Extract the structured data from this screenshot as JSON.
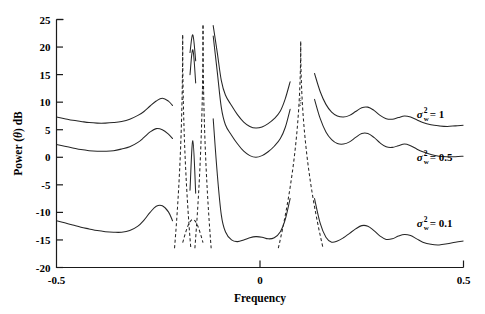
{
  "figure": {
    "background": "#ffffff",
    "ink_color": "#262626"
  },
  "axes": {
    "x_label": "Frequency",
    "y_label_prefix": "Power (",
    "y_label_theta": "θ",
    "y_label_suffix": ") dB",
    "y_label_full": "Power (θ) dB",
    "x_ticks": [
      "-0.5",
      "0",
      "0.5"
    ],
    "x_tick_values": [
      -0.5,
      0,
      0.5
    ],
    "y_ticks": [
      "25",
      "20",
      "15",
      "10",
      "5",
      "0",
      "-5",
      "-10",
      "-15",
      "-20"
    ],
    "y_tick_values": [
      25,
      20,
      15,
      10,
      5,
      0,
      -5,
      -10,
      -15,
      -20
    ],
    "xlim": [
      -0.5,
      0.5
    ],
    "ylim": [
      -20,
      25
    ]
  },
  "annotations": [
    {
      "id": "sigma-1",
      "symbol": "σ",
      "sub": "w",
      "sup": "2",
      "equals": "= 1",
      "value": 1,
      "x": 0.385,
      "y": 7.2
    },
    {
      "id": "sigma-05",
      "symbol": "σ",
      "sub": "w",
      "sup": "2",
      "equals": "= 0.5",
      "value": 0.5,
      "x": 0.385,
      "y": -0.6
    },
    {
      "id": "sigma-01",
      "symbol": "σ",
      "sub": "w",
      "sup": "2",
      "equals": "= 0.1",
      "value": 0.1,
      "x": 0.385,
      "y": -12.6
    }
  ],
  "chart_data": {
    "type": "line",
    "title": "",
    "xlabel": "Frequency",
    "ylabel": "Power (θ) dB",
    "xlim": [
      -0.5,
      0.5
    ],
    "ylim": [
      -20,
      25
    ],
    "grid": false,
    "legend": "inline-right-annotations",
    "x_ticks": [
      -0.5,
      0,
      0.5
    ],
    "y_ticks": [
      25,
      20,
      15,
      10,
      5,
      0,
      -5,
      -10,
      -15,
      -20
    ],
    "series": [
      {
        "name": "sigma_w^2 = 1",
        "style": "solid",
        "linestyle": "-",
        "peak_frequencies": [
          -0.19,
          -0.14,
          0.1
        ],
        "peak_values_db": [
          22.2,
          23.9,
          21.0
        ],
        "x": [
          -0.5,
          -0.48,
          -0.46,
          -0.44,
          -0.42,
          -0.4,
          -0.38,
          -0.36,
          -0.34,
          -0.32,
          -0.3,
          -0.285,
          -0.27,
          -0.255,
          -0.24,
          -0.225,
          -0.215,
          -0.205,
          -0.198,
          -0.192,
          -0.186,
          -0.18,
          -0.172,
          -0.165,
          -0.158,
          -0.15,
          -0.144,
          -0.138,
          -0.132,
          -0.125,
          -0.115,
          -0.105,
          -0.095,
          -0.085,
          -0.07,
          -0.055,
          -0.04,
          -0.025,
          -0.01,
          0.005,
          0.02,
          0.035,
          0.05,
          0.062,
          0.074,
          0.086,
          0.096,
          0.104,
          0.112,
          0.122,
          0.134,
          0.148,
          0.162,
          0.176,
          0.19,
          0.205,
          0.22,
          0.235,
          0.25,
          0.265,
          0.28,
          0.295,
          0.31,
          0.325,
          0.34,
          0.355,
          0.37,
          0.385,
          0.4,
          0.42,
          0.44,
          0.46,
          0.48,
          0.5
        ],
        "y": [
          7.3,
          7.0,
          6.7,
          6.5,
          6.3,
          6.2,
          6.2,
          6.3,
          6.5,
          6.9,
          7.6,
          8.3,
          9.3,
          10.2,
          10.7,
          10.2,
          9.4,
          8.5,
          8.2,
          9.0,
          11.5,
          15.0,
          19.0,
          22.2,
          17.5,
          11.9,
          10.3,
          11.2,
          14.5,
          19.5,
          23.9,
          19.0,
          13.9,
          11.3,
          9.4,
          7.7,
          6.4,
          5.6,
          5.3,
          5.5,
          6.1,
          7.0,
          8.4,
          10.6,
          13.7,
          17.5,
          20.2,
          21.0,
          20.5,
          18.3,
          15.2,
          11.9,
          9.6,
          8.2,
          7.5,
          7.3,
          7.6,
          8.3,
          9.0,
          9.1,
          8.5,
          7.6,
          7.0,
          6.9,
          7.2,
          7.5,
          7.3,
          6.8,
          6.3,
          5.9,
          5.7,
          5.6,
          5.7,
          5.8
        ]
      },
      {
        "name": "sigma_w^2 = 0.5",
        "style": "solid",
        "linestyle": "-",
        "peak_frequencies": [
          -0.19,
          -0.14,
          0.1
        ],
        "peak_values_db": [
          22.2,
          23.9,
          21.0
        ],
        "x": [
          -0.5,
          -0.48,
          -0.46,
          -0.44,
          -0.42,
          -0.4,
          -0.38,
          -0.36,
          -0.34,
          -0.32,
          -0.3,
          -0.285,
          -0.27,
          -0.255,
          -0.24,
          -0.225,
          -0.215,
          -0.205,
          -0.198,
          -0.192,
          -0.186,
          -0.18,
          -0.172,
          -0.165,
          -0.158,
          -0.15,
          -0.144,
          -0.138,
          -0.132,
          -0.125,
          -0.115,
          -0.105,
          -0.095,
          -0.085,
          -0.07,
          -0.055,
          -0.04,
          -0.025,
          -0.01,
          0.005,
          0.02,
          0.035,
          0.05,
          0.062,
          0.074,
          0.086,
          0.096,
          0.104,
          0.112,
          0.122,
          0.134,
          0.148,
          0.162,
          0.176,
          0.19,
          0.205,
          0.22,
          0.235,
          0.25,
          0.265,
          0.28,
          0.295,
          0.31,
          0.325,
          0.34,
          0.355,
          0.37,
          0.385,
          0.4,
          0.42,
          0.44,
          0.46,
          0.48,
          0.5
        ],
        "y": [
          2.3,
          2.0,
          1.7,
          1.4,
          1.2,
          1.1,
          1.1,
          1.2,
          1.5,
          1.9,
          2.7,
          3.6,
          4.6,
          5.2,
          5.0,
          4.2,
          3.4,
          2.6,
          2.4,
          3.3,
          6.0,
          10.0,
          15.0,
          19.5,
          13.5,
          7.0,
          5.2,
          6.2,
          9.6,
          15.5,
          22.0,
          15.5,
          9.0,
          5.9,
          4.0,
          2.4,
          1.1,
          0.3,
          0.0,
          0.3,
          1.0,
          2.0,
          3.4,
          5.4,
          8.7,
          13.0,
          16.2,
          17.2,
          16.5,
          14.0,
          10.5,
          7.0,
          4.6,
          3.2,
          2.5,
          2.4,
          2.8,
          3.6,
          4.3,
          4.3,
          3.6,
          2.6,
          1.9,
          1.8,
          2.1,
          2.4,
          2.1,
          1.5,
          1.0,
          0.5,
          0.2,
          0.1,
          0.1,
          0.2
        ]
      },
      {
        "name": "sigma_w^2 = 0.1",
        "style": "solid",
        "linestyle": "-",
        "peak_frequencies": [
          -0.19,
          -0.14,
          0.1
        ],
        "peak_values_db": [
          22.2,
          23.9,
          21.0
        ],
        "x": [
          -0.5,
          -0.48,
          -0.46,
          -0.44,
          -0.42,
          -0.4,
          -0.38,
          -0.36,
          -0.34,
          -0.32,
          -0.3,
          -0.285,
          -0.27,
          -0.255,
          -0.24,
          -0.225,
          -0.215,
          -0.205,
          -0.198,
          -0.192,
          -0.186,
          -0.18,
          -0.172,
          -0.165,
          -0.158,
          -0.15,
          -0.144,
          -0.138,
          -0.132,
          -0.125,
          -0.115,
          -0.105,
          -0.095,
          -0.085,
          -0.07,
          -0.055,
          -0.04,
          -0.025,
          -0.01,
          0.005,
          0.02,
          0.035,
          0.05,
          0.062,
          0.074,
          0.086,
          0.096,
          0.104,
          0.112,
          0.122,
          0.134,
          0.148,
          0.162,
          0.176,
          0.19,
          0.205,
          0.22,
          0.235,
          0.25,
          0.265,
          0.28,
          0.295,
          0.31,
          0.325,
          0.34,
          0.355,
          0.37,
          0.385,
          0.4,
          0.42,
          0.44,
          0.46,
          0.48,
          0.5
        ],
        "y": [
          -11.5,
          -11.9,
          -12.3,
          -12.7,
          -13.0,
          -13.3,
          -13.5,
          -13.6,
          -13.6,
          -13.3,
          -12.5,
          -11.4,
          -10.0,
          -8.9,
          -8.8,
          -9.9,
          -11.5,
          -13.4,
          -14.6,
          -15.1,
          -14.5,
          -12.0,
          -6.0,
          3.0,
          -6.5,
          -13.0,
          -14.9,
          -14.2,
          -11.0,
          -4.0,
          7.0,
          -3.0,
          -10.5,
          -13.5,
          -15.0,
          -15.3,
          -15.0,
          -14.6,
          -14.4,
          -14.5,
          -14.8,
          -14.6,
          -13.5,
          -11.3,
          -7.5,
          -2.5,
          1.5,
          2.6,
          1.2,
          -2.5,
          -7.5,
          -12.0,
          -14.5,
          -15.4,
          -15.2,
          -14.6,
          -13.8,
          -13.0,
          -12.4,
          -12.5,
          -13.3,
          -14.3,
          -14.9,
          -14.8,
          -14.3,
          -14.0,
          -14.2,
          -14.8,
          -15.4,
          -15.8,
          -15.9,
          -15.7,
          -15.4,
          -15.2
        ]
      }
    ],
    "dashed_overlay": {
      "name": "sharp resonance lobes",
      "style": "dashed",
      "description": "Dashed vertical lobes rising from the sigma_w^2 = 0.1 baseline to the tall peaks shared by all traces.",
      "lobes": [
        {
          "center": -0.19,
          "peak_db": 22.2,
          "half_width": 0.02
        },
        {
          "center": -0.14,
          "peak_db": 23.9,
          "half_width": 0.02
        },
        {
          "center": 0.1,
          "peak_db": 21.0,
          "half_width": 0.055
        }
      ]
    }
  }
}
